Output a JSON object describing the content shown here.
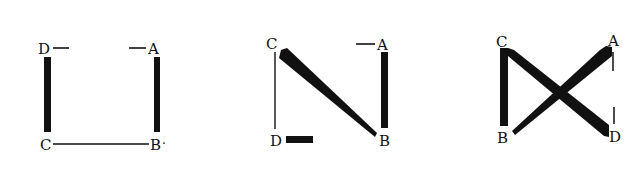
{
  "diagram": {
    "colors": {
      "ink": "#111111",
      "background": "#ffffff"
    },
    "figures": [
      {
        "id": "figure-1",
        "labels": {
          "D": "D",
          "A": "A",
          "C": "C",
          "B": "B"
        },
        "edges": [
          {
            "from": "D",
            "to": "C",
            "weight": "thick"
          },
          {
            "from": "A",
            "to": "B",
            "weight": "thick"
          },
          {
            "from": "C",
            "to": "B",
            "weight": "thin"
          }
        ],
        "ticks": [
          {
            "at": "D",
            "direction": "right",
            "weight": "thin"
          },
          {
            "at": "A",
            "direction": "left",
            "weight": "thin"
          }
        ],
        "extra_mark": "·"
      },
      {
        "id": "figure-2",
        "labels": {
          "C": "C",
          "A": "A",
          "D": "D",
          "B": "B"
        },
        "edges": [
          {
            "from": "C",
            "to": "D",
            "weight": "thin"
          },
          {
            "from": "C",
            "to": "B",
            "weight": "thick-tapering"
          },
          {
            "from": "A",
            "to": "B",
            "weight": "thick"
          }
        ],
        "ticks": [
          {
            "at": "A",
            "direction": "left",
            "weight": "thin"
          },
          {
            "at": "D",
            "direction": "right",
            "weight": "thick"
          }
        ]
      },
      {
        "id": "figure-3",
        "labels": {
          "C": "C",
          "A": "A",
          "B": "B",
          "D": "D"
        },
        "edges": [
          {
            "from": "C",
            "to": "B",
            "weight": "thick"
          },
          {
            "from": "C",
            "to": "D",
            "weight": "thick-widening"
          },
          {
            "from": "B",
            "to": "A",
            "weight": "thick-widening"
          }
        ],
        "ticks": [
          {
            "at": "A",
            "direction": "down",
            "weight": "thin"
          },
          {
            "at": "D",
            "direction": "up",
            "weight": "thin"
          }
        ]
      }
    ]
  }
}
